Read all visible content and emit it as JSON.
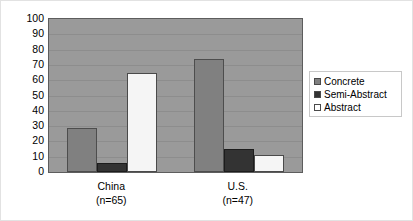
{
  "chart_data": {
    "type": "bar",
    "title": "",
    "subtitle": "",
    "xlabel": "",
    "ylabel": "",
    "categories": [
      "China",
      "U.S."
    ],
    "category_sublabels": [
      "(n=65)",
      "(n=47)"
    ],
    "category_labels_full": [
      "China (n=65)",
      "U.S. (n=47)"
    ],
    "series": [
      {
        "name": "Concrete",
        "values": [
          29,
          74
        ],
        "color": "#808080"
      },
      {
        "name": "Semi-Abstract",
        "values": [
          6,
          15
        ],
        "color": "#333333"
      },
      {
        "name": "Abstract",
        "values": [
          65,
          11
        ],
        "color": "#f5f5f5"
      }
    ],
    "ylim": [
      0,
      100
    ],
    "ytick_step": 10,
    "yticks": [
      100,
      90,
      80,
      70,
      60,
      50,
      40,
      30,
      20,
      10,
      0
    ],
    "ytick_labels": [
      "100",
      "90",
      "80",
      "70",
      "60",
      "50",
      "40",
      "30",
      "20",
      "10",
      "0"
    ],
    "grid": true,
    "grid_axis": "y",
    "legend": true,
    "legend_position": "right",
    "legend_entries": [
      "Concrete",
      "Semi-Abstract",
      "Abstract"
    ],
    "plot_background": "#9a9a9a",
    "figure_background": "#ffffff",
    "axis_color": "#5d5d5d",
    "gridline_color": "#8d8d8d",
    "bar_outline_color": "#4a4a4a"
  }
}
